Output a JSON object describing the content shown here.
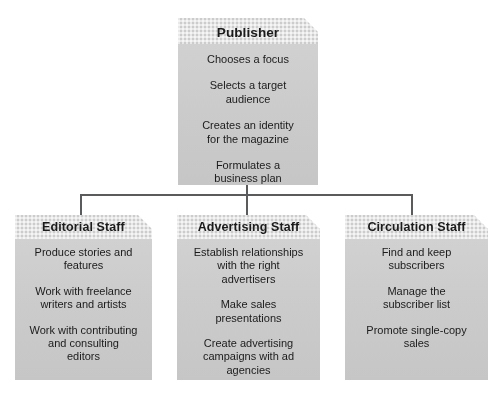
{
  "diagram": {
    "type": "organizational-hierarchy-flowchart",
    "colors": {
      "box_fill": "#cfcfcf",
      "header_band": "#cccccc",
      "connector": "#5a5b5d",
      "text": "#1b1b1b",
      "background": "#ffffff"
    },
    "root": {
      "id": "publisher",
      "title": "Publisher",
      "items": [
        "Chooses a focus",
        "Selects a target\naudience",
        "Creates an identity\nfor the magazine",
        "Formulates a\nbusiness plan"
      ]
    },
    "children": [
      {
        "id": "editorial",
        "title": "Editorial Staff",
        "items": [
          "Produce stories and\nfeatures",
          "Work with freelance\nwriters and artists",
          "Work with contributing\nand consulting\neditors"
        ]
      },
      {
        "id": "advertising",
        "title": "Advertising Staff",
        "items": [
          "Establish relationships\nwith the right\nadvertisers",
          "Make sales\npresentations",
          "Create advertising\ncampaigns with ad\nagencies"
        ]
      },
      {
        "id": "circulation",
        "title": "Circulation Staff",
        "items": [
          "Find and keep\nsubscribers",
          "Manage the\nsubscriber list",
          "Promote single-copy\nsales"
        ]
      }
    ]
  }
}
